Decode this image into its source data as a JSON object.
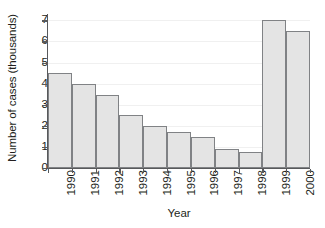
{
  "chart_data": {
    "type": "bar",
    "title": "",
    "xlabel": "Year",
    "ylabel": "Number of cases (thousands)",
    "categories": [
      "1990",
      "1991",
      "1992",
      "1993",
      "1994",
      "1995",
      "1996",
      "1997",
      "1998",
      "1999",
      "2000"
    ],
    "values": [
      4.5,
      4.0,
      3.45,
      2.5,
      2.0,
      1.7,
      1.45,
      0.9,
      0.75,
      7.0,
      6.5
    ],
    "ylim": [
      0,
      7.3
    ],
    "yticks": [
      0,
      1,
      2,
      3,
      4,
      5,
      6,
      7
    ],
    "ytick_labels": [
      "0",
      "1",
      "2",
      "3",
      "4",
      "5",
      "6",
      "7"
    ],
    "grid": true,
    "grid_axis": "y",
    "legend": "none",
    "bar_fill_color": "#e4e4e4",
    "bar_edge_color": "#808285",
    "axis_color": "#58595b",
    "gridline_color": "#f0f0f0",
    "background_color": "#ffffff",
    "text_color": "#231f20",
    "xtick_rotation": 90
  }
}
